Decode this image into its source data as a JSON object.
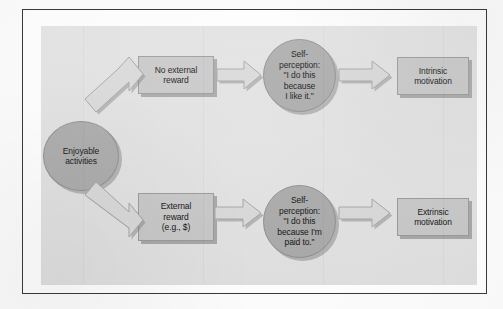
{
  "figure": {
    "background_color": "#e3e3e3",
    "frame_color": "#3a3a3a",
    "box_fill": "#c9c9c9",
    "circle_fill": "#ababab",
    "arrow_fill": "#dadada",
    "text_color": "#111111"
  },
  "nodes": {
    "enjoyable_activities": {
      "line1": "Enjoyable",
      "line2": "activities",
      "shape": "circle"
    },
    "no_external_reward": {
      "line1": "No external",
      "line2": "reward",
      "shape": "box"
    },
    "self_perception_intrinsic": {
      "line1": "Self-",
      "line2": "perception:",
      "line3": "\"I do this",
      "line4": "because",
      "line5": "I like it.\"",
      "shape": "circle"
    },
    "intrinsic_motivation": {
      "line1": "Intrinsic",
      "line2": "motivation",
      "shape": "box"
    },
    "external_reward": {
      "line1": "External",
      "line2": "reward",
      "line3": "(e.g., $)",
      "shape": "box"
    },
    "self_perception_extrinsic": {
      "line1": "Self-",
      "line2": "perception:",
      "line3": "\"I do this",
      "line4": "because I'm",
      "line5": "paid to.\"",
      "shape": "circle"
    },
    "extrinsic_motivation": {
      "line1": "Extrinsic",
      "line2": "motivation",
      "shape": "box"
    }
  },
  "arrows": [
    {
      "name": "enjoyable-to-no-external-reward",
      "direction": "up-right"
    },
    {
      "name": "enjoyable-to-external-reward",
      "direction": "down-right"
    },
    {
      "name": "no-external-reward-to-self-perception",
      "direction": "right"
    },
    {
      "name": "self-perception-to-intrinsic-motivation",
      "direction": "right"
    },
    {
      "name": "external-reward-to-self-perception",
      "direction": "right"
    },
    {
      "name": "self-perception-to-extrinsic-motivation",
      "direction": "right"
    }
  ]
}
